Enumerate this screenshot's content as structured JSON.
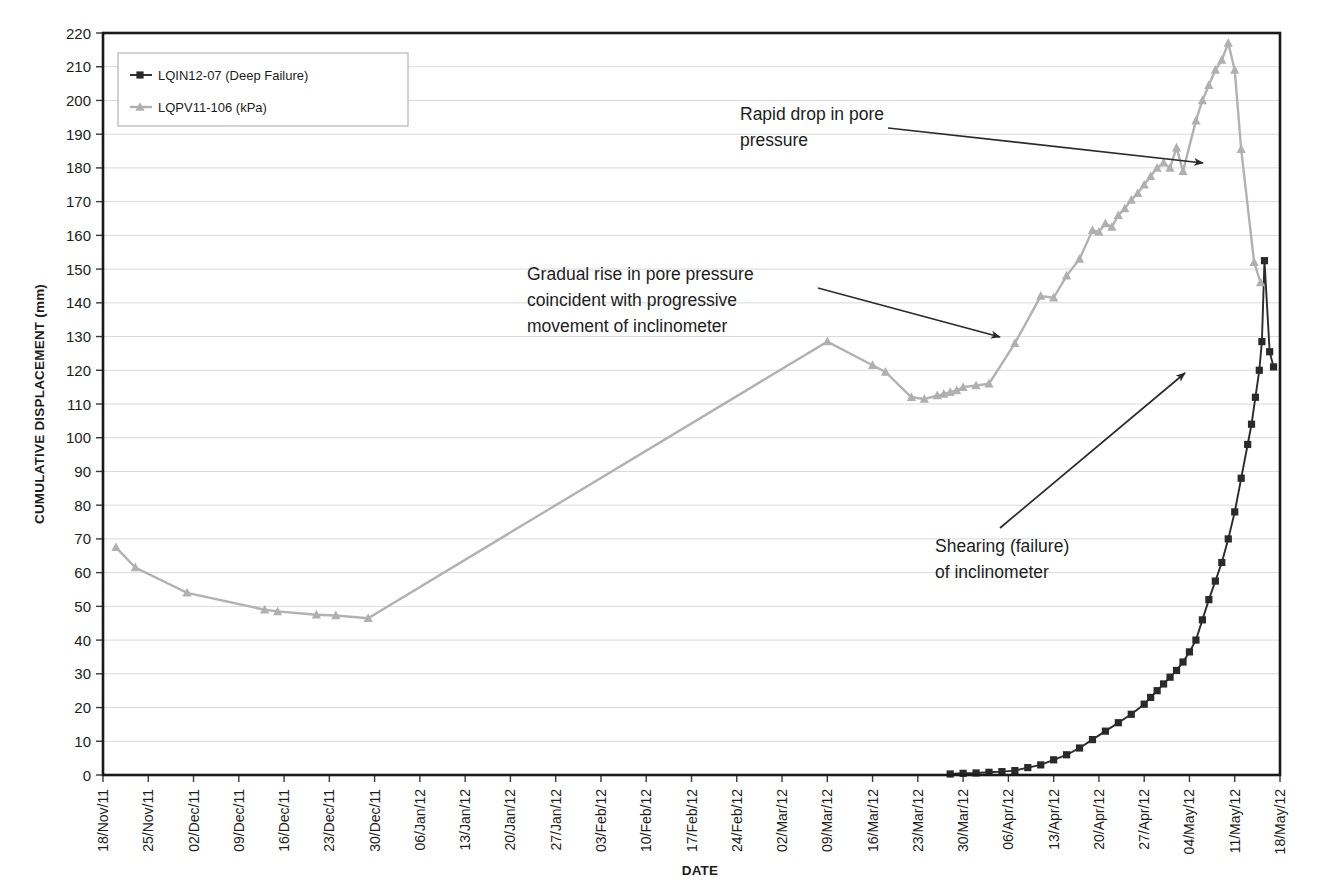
{
  "chart_data": {
    "type": "line",
    "title": "",
    "xlabel": "DATE",
    "ylabel": "CUMULATIVE DISPLACEMENT (mm)",
    "ylim": [
      0,
      220
    ],
    "ytick_step": 10,
    "yticks": [
      0,
      10,
      20,
      30,
      40,
      50,
      60,
      70,
      80,
      90,
      100,
      110,
      120,
      130,
      140,
      150,
      160,
      170,
      180,
      190,
      200,
      210,
      220
    ],
    "grid": "horizontal",
    "legend_position": "top-left",
    "x_tick_labels": [
      "18/Nov/11",
      "25/Nov/11",
      "02/Dec/11",
      "09/Dec/11",
      "16/Dec/11",
      "23/Dec/11",
      "30/Dec/11",
      "06/Jan/12",
      "13/Jan/12",
      "20/Jan/12",
      "27/Jan/12",
      "03/Feb/12",
      "10/Feb/12",
      "17/Feb/12",
      "24/Feb/12",
      "02/Mar/12",
      "09/Mar/12",
      "16/Mar/12",
      "23/Mar/12",
      "30/Mar/12",
      "06/Apr/12",
      "13/Apr/12",
      "20/Apr/12",
      "27/Apr/12",
      "04/May/12",
      "11/May/12",
      "18/May/12"
    ],
    "x_domain_days": [
      0,
      182
    ],
    "series": [
      {
        "name": "LQIN12-07 (Deep Failure)",
        "color": "#2a2a2a",
        "marker": "square",
        "points": [
          {
            "day": 131,
            "value": 0.3
          },
          {
            "day": 133,
            "value": 0.5
          },
          {
            "day": 135,
            "value": 0.6
          },
          {
            "day": 137,
            "value": 0.8
          },
          {
            "day": 139,
            "value": 1.0
          },
          {
            "day": 141,
            "value": 1.3
          },
          {
            "day": 143,
            "value": 2.2
          },
          {
            "day": 145,
            "value": 3.0
          },
          {
            "day": 147,
            "value": 4.5
          },
          {
            "day": 149,
            "value": 6.0
          },
          {
            "day": 151,
            "value": 8.0
          },
          {
            "day": 153,
            "value": 10.5
          },
          {
            "day": 155,
            "value": 13.0
          },
          {
            "day": 157,
            "value": 15.5
          },
          {
            "day": 159,
            "value": 18.0
          },
          {
            "day": 161,
            "value": 21.0
          },
          {
            "day": 162,
            "value": 23.0
          },
          {
            "day": 163,
            "value": 25.0
          },
          {
            "day": 164,
            "value": 27.0
          },
          {
            "day": 165,
            "value": 29.0
          },
          {
            "day": 166,
            "value": 31.0
          },
          {
            "day": 167,
            "value": 33.5
          },
          {
            "day": 168,
            "value": 36.5
          },
          {
            "day": 169,
            "value": 40.0
          },
          {
            "day": 170,
            "value": 46.0
          },
          {
            "day": 171,
            "value": 52.0
          },
          {
            "day": 172,
            "value": 57.5
          },
          {
            "day": 173,
            "value": 63.0
          },
          {
            "day": 174,
            "value": 70.0
          },
          {
            "day": 175,
            "value": 78.0
          },
          {
            "day": 176,
            "value": 88.0
          },
          {
            "day": 177,
            "value": 98.0
          },
          {
            "day": 177.6,
            "value": 104.0
          },
          {
            "day": 178.2,
            "value": 112.0
          },
          {
            "day": 178.8,
            "value": 120.0
          },
          {
            "day": 179.2,
            "value": 128.5
          },
          {
            "day": 179.6,
            "value": 152.5
          },
          {
            "day": 180.4,
            "value": 125.5
          },
          {
            "day": 181.0,
            "value": 121.0
          }
        ]
      },
      {
        "name": "LQPV11-106 (kPa)",
        "color": "#b0b0b0",
        "marker": "triangle",
        "points": [
          {
            "day": 2,
            "value": 67.5
          },
          {
            "day": 5,
            "value": 61.5
          },
          {
            "day": 13,
            "value": 54.0
          },
          {
            "day": 25,
            "value": 49.0
          },
          {
            "day": 27,
            "value": 48.5
          },
          {
            "day": 33,
            "value": 47.5
          },
          {
            "day": 36,
            "value": 47.3
          },
          {
            "day": 41,
            "value": 46.5
          },
          {
            "day": 112,
            "value": 128.5
          },
          {
            "day": 119,
            "value": 121.5
          },
          {
            "day": 121,
            "value": 119.5
          },
          {
            "day": 125,
            "value": 112.0
          },
          {
            "day": 127,
            "value": 111.5
          },
          {
            "day": 129,
            "value": 112.5
          },
          {
            "day": 130,
            "value": 113.0
          },
          {
            "day": 131,
            "value": 113.5
          },
          {
            "day": 132,
            "value": 114.0
          },
          {
            "day": 133,
            "value": 115.0
          },
          {
            "day": 135,
            "value": 115.5
          },
          {
            "day": 137,
            "value": 116.0
          },
          {
            "day": 141,
            "value": 128.0
          },
          {
            "day": 145,
            "value": 142.0
          },
          {
            "day": 147,
            "value": 141.5
          },
          {
            "day": 149,
            "value": 148.0
          },
          {
            "day": 151,
            "value": 153.0
          },
          {
            "day": 153,
            "value": 161.5
          },
          {
            "day": 154,
            "value": 161.0
          },
          {
            "day": 155,
            "value": 163.5
          },
          {
            "day": 156,
            "value": 162.5
          },
          {
            "day": 157,
            "value": 166.0
          },
          {
            "day": 158,
            "value": 168.0
          },
          {
            "day": 159,
            "value": 170.5
          },
          {
            "day": 160,
            "value": 172.5
          },
          {
            "day": 161,
            "value": 175.0
          },
          {
            "day": 162,
            "value": 177.5
          },
          {
            "day": 163,
            "value": 180.0
          },
          {
            "day": 164,
            "value": 181.5
          },
          {
            "day": 165,
            "value": 180.0
          },
          {
            "day": 166,
            "value": 186.0
          },
          {
            "day": 167,
            "value": 179.0
          },
          {
            "day": 169,
            "value": 194.0
          },
          {
            "day": 170,
            "value": 200.0
          },
          {
            "day": 171,
            "value": 204.5
          },
          {
            "day": 172,
            "value": 209.0
          },
          {
            "day": 173,
            "value": 212.0
          },
          {
            "day": 174,
            "value": 217.0
          },
          {
            "day": 175,
            "value": 209.0
          },
          {
            "day": 176,
            "value": 185.5
          },
          {
            "day": 178,
            "value": 152.0
          },
          {
            "day": 179,
            "value": 146.0
          }
        ]
      }
    ],
    "annotations": [
      {
        "id": "rapid-drop",
        "lines": [
          "Rapid drop in pore",
          "pressure"
        ],
        "text_x": 740,
        "text_y": 120,
        "arrow": [
          [
            888,
            128
          ],
          [
            1203,
            163
          ]
        ]
      },
      {
        "id": "gradual-rise",
        "lines": [
          "Gradual rise in pore pressure",
          "coincident with progressive",
          "movement of inclinometer"
        ],
        "text_x": 527,
        "text_y": 280,
        "arrow": [
          [
            818,
            288
          ],
          [
            1000,
            337
          ]
        ]
      },
      {
        "id": "shearing-failure",
        "lines": [
          "Shearing (failure)",
          "of inclinometer"
        ],
        "text_x": 935,
        "text_y": 552,
        "arrow": [
          [
            1000,
            528
          ],
          [
            1185,
            373
          ]
        ]
      }
    ]
  }
}
